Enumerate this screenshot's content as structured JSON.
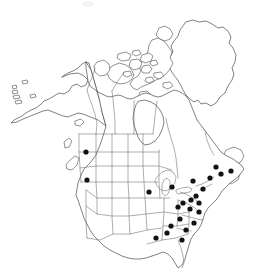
{
  "figure": {
    "title": "",
    "caption": "",
    "map_region": "North America",
    "projection": "conic",
    "background_color": "#ffffff",
    "outline_color": "#4a4a4a",
    "border_color": "#6b6b6b",
    "dot_color": "#121212",
    "dot_radius_px": 2.6
  },
  "legend": {
    "symbol_label": "occurrence record",
    "visible": false
  },
  "chart_data": {
    "type": "scatter",
    "title": "",
    "xlabel": "",
    "ylabel": "",
    "units": "pixel coordinates on map image",
    "xlim": [
      0,
      265
    ],
    "ylim": [
      0,
      275
    ],
    "grid": false,
    "legend_position": "none",
    "series": [
      {
        "name": "occurrence records",
        "marker": "filled-circle",
        "color": "#121212",
        "points": [
          {
            "id": "d01",
            "x": 86,
            "y": 152,
            "region": "Montana / Idaho"
          },
          {
            "id": "d02",
            "x": 87,
            "y": 180,
            "region": "Washington / Oregon"
          },
          {
            "id": "d03",
            "x": 149,
            "y": 192,
            "region": "Iowa / Minnesota"
          },
          {
            "id": "d04",
            "x": 172,
            "y": 187,
            "region": "Michigan"
          },
          {
            "id": "d05",
            "x": 193,
            "y": 181,
            "region": "New York"
          },
          {
            "id": "d06",
            "x": 210,
            "y": 178,
            "region": "Vermont / New Hampshire"
          },
          {
            "id": "d07",
            "x": 221,
            "y": 174,
            "region": "Maine"
          },
          {
            "id": "d08",
            "x": 231,
            "y": 171,
            "region": "New Brunswick"
          },
          {
            "id": "d09",
            "x": 216,
            "y": 167,
            "region": "Quebec / Gaspe"
          },
          {
            "id": "d10",
            "x": 203,
            "y": 189,
            "region": "Massachusetts / Connecticut"
          },
          {
            "id": "d11",
            "x": 196,
            "y": 196,
            "region": "New Jersey"
          },
          {
            "id": "d12",
            "x": 191,
            "y": 200,
            "region": "Pennsylvania"
          },
          {
            "id": "d13",
            "x": 199,
            "y": 203,
            "region": "Maryland / Delaware"
          },
          {
            "id": "d14",
            "x": 183,
            "y": 203,
            "region": "Ohio"
          },
          {
            "id": "d15",
            "x": 178,
            "y": 207,
            "region": "Indiana / Ohio"
          },
          {
            "id": "d16",
            "x": 190,
            "y": 209,
            "region": "West Virginia / Virginia"
          },
          {
            "id": "d17",
            "x": 199,
            "y": 212,
            "region": "Virginia"
          },
          {
            "id": "d18",
            "x": 180,
            "y": 219,
            "region": "Kentucky / Tennessee"
          },
          {
            "id": "d19",
            "x": 194,
            "y": 223,
            "region": "North Carolina"
          },
          {
            "id": "d20",
            "x": 171,
            "y": 226,
            "region": "Tennessee"
          },
          {
            "id": "d21",
            "x": 186,
            "y": 230,
            "region": "South Carolina / Georgia"
          },
          {
            "id": "d22",
            "x": 167,
            "y": 233,
            "region": "Mississippi / Alabama"
          },
          {
            "id": "d23",
            "x": 156,
            "y": 238,
            "region": "Louisiana / Mississippi"
          },
          {
            "id": "d24",
            "x": 182,
            "y": 240,
            "region": "Georgia"
          }
        ]
      }
    ],
    "point_count": 24
  }
}
